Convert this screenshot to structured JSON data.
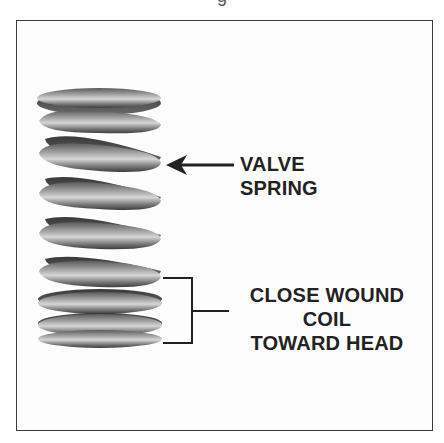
{
  "caption": {
    "clipped_text": "g"
  },
  "figure": {
    "labels": {
      "valve_spring": [
        "VALVE",
        "SPRING"
      ],
      "close_wound": [
        "CLOSE WOUND",
        "COIL",
        "TOWARD HEAD"
      ]
    },
    "annotations": {
      "arrow": "left-arrow pointing at spring",
      "bracket": "bracket marking close-wound coils at bottom"
    },
    "colors": {
      "ink": "#222222",
      "spring_dark": "#4a4a4a",
      "spring_mid": "#8a8a8a",
      "spring_light": "#cfcfcf",
      "frame": "#3a3a3a"
    }
  }
}
